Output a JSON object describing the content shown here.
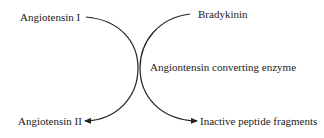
{
  "diagram": {
    "substrates": {
      "left_input": "Angiotensin I",
      "right_input": "Bradykinin"
    },
    "enzyme": "Angiontensin converting enzyme",
    "products": {
      "left_output": "Angiotensin II",
      "right_output": "Inactive peptide fragments"
    },
    "colors": {
      "line": "#222222",
      "text": "#222222",
      "background": "#ffffff"
    }
  }
}
